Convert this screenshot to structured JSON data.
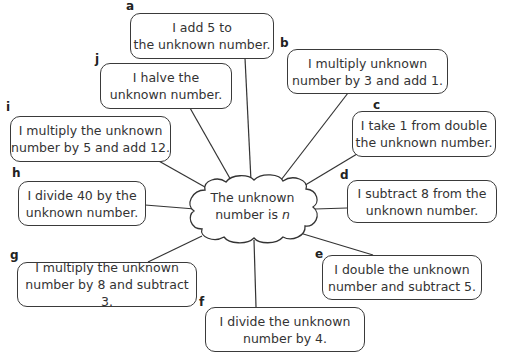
{
  "center": {
    "line1": "The unknown",
    "line2_prefix": "number is ",
    "variable": "n"
  },
  "statements": [
    {
      "id": "a",
      "line1": "I add 5 to",
      "line2": "the unknown number."
    },
    {
      "id": "b",
      "line1": "I multiply unknown",
      "line2": "number by 3 and add 1."
    },
    {
      "id": "c",
      "line1": "I take 1 from double",
      "line2": "the unknown number."
    },
    {
      "id": "d",
      "line1": "I subtract 8 from the",
      "line2": "unknown number."
    },
    {
      "id": "e",
      "line1": "I double the unknown",
      "line2": "number and subtract 5."
    },
    {
      "id": "f",
      "line1": "I divide the unknown",
      "line2": "number by 4."
    },
    {
      "id": "g",
      "line1": "I multiply the unknown",
      "line2": "number by 8 and subtract 3."
    },
    {
      "id": "h",
      "line1": "I divide 40 by the",
      "line2": "unknown number."
    },
    {
      "id": "i",
      "line1": "I multiply the unknown",
      "line2": "number by 5 and add 12."
    },
    {
      "id": "j",
      "line1": "I halve the",
      "line2": "unknown number."
    }
  ]
}
